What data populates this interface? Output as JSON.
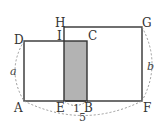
{
  "figure": {
    "points": {
      "A": "A",
      "B": "B",
      "C": "C",
      "D": "D",
      "E": "E",
      "F": "F",
      "G": "G",
      "H": "H",
      "I": "I"
    },
    "measurements": {
      "side_a": "a",
      "side_b": "b",
      "EB": "1",
      "AF": "5"
    },
    "colors": {
      "line": "#333333",
      "shaded": "#b3b3b3",
      "dashed": "#999999"
    }
  }
}
